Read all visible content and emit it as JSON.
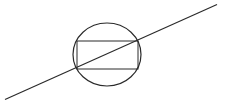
{
  "diagram": {
    "colors": {
      "background": "#ffffff",
      "stroke": "#2a2a2a"
    },
    "shapes": {
      "circle": {
        "cx": 107,
        "cy": 54.5,
        "rx": 34,
        "ry": 31.5
      },
      "rectangle": {
        "x": 77,
        "y": 41,
        "width": 61,
        "height": 28
      },
      "line": {
        "x1": 5,
        "y1": 99.5,
        "x2": 217,
        "y2": 4.5
      }
    }
  }
}
